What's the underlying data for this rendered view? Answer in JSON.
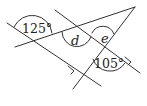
{
  "diagram": {
    "type": "geometry-angles",
    "angles": [
      {
        "id": "angle-125",
        "label": "125°"
      },
      {
        "id": "angle-d",
        "label": "d"
      },
      {
        "id": "angle-e",
        "label": "e"
      },
      {
        "id": "angle-105",
        "label": "105°"
      }
    ],
    "colors": {
      "line": "#333333",
      "background": "#ffffff"
    }
  }
}
